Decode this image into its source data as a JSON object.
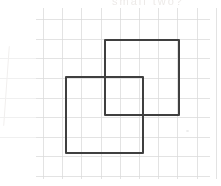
{
  "scene": {
    "type": "drawing",
    "description": "Two overlapping square outlines drawn on faint graph paper",
    "background_color": "#ffffff",
    "grid_color": "#d9d9d9",
    "faint_grid_color": "#f0f0f0",
    "square_stroke_color": "#3f3f3f",
    "faint_text": "small two?"
  },
  "grid": {
    "vertical_lines_x": [
      43,
      62,
      81,
      101,
      120,
      139,
      158,
      177,
      197,
      216
    ],
    "vertical_span_y": [
      8,
      179
    ],
    "horizontal_lines_y": [
      19,
      39,
      58,
      78,
      98,
      117,
      137,
      156,
      176
    ],
    "horizontal_span_x": [
      36,
      210
    ],
    "faint_left_lines_y": [
      58,
      78,
      98,
      117,
      137
    ],
    "faint_left_span_x": [
      0,
      36
    ]
  },
  "squares": [
    {
      "name": "upper-right-square",
      "left": 104,
      "top": 39,
      "width": 76,
      "height": 77
    },
    {
      "name": "lower-left-square",
      "left": 65,
      "top": 76,
      "width": 79,
      "height": 78
    }
  ],
  "artifacts": {
    "smudge_dot": {
      "x": 186,
      "y": 130
    },
    "left_curve": {
      "x": 6,
      "top": 46,
      "height": 80
    }
  }
}
